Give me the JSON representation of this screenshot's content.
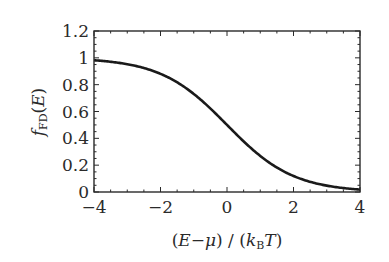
{
  "chart_data": {
    "type": "line",
    "title": "",
    "xlabel": "(E−μ) / (k_B T)",
    "ylabel": "f_FD(E)",
    "xlabel_parts": {
      "open1": "(",
      "E": "E",
      "minus": "−",
      "mu": "μ",
      "close1": ")",
      "slash": " / ",
      "open2": "(",
      "k": "k",
      "B": "B",
      "T": "T",
      "close2": ")"
    },
    "ylabel_parts": {
      "f": "f",
      "sub": "FD",
      "open": "(",
      "E": "E",
      "close": ")"
    },
    "xlim": [
      -4,
      4
    ],
    "ylim": [
      0,
      1.2
    ],
    "xticks": [
      -4,
      -2,
      0,
      2,
      4
    ],
    "xtick_labels": [
      "−4",
      "−2",
      "0",
      "2",
      "4"
    ],
    "yticks": [
      0,
      0.2,
      0.4,
      0.6,
      0.8,
      1,
      1.2
    ],
    "ytick_labels": [
      "0",
      "0.2",
      "0.4",
      "0.6",
      "0.8",
      "1",
      "1.2"
    ],
    "grid": false,
    "legend": "none",
    "series": [
      {
        "name": "Fermi-Dirac distribution",
        "function": "1/(1+exp(x))",
        "x": [
          -4,
          -3.5,
          -3,
          -2.5,
          -2,
          -1.5,
          -1,
          -0.5,
          0,
          0.5,
          1,
          1.5,
          2,
          2.5,
          3,
          3.5,
          4
        ],
        "y": [
          0.982,
          0.971,
          0.953,
          0.924,
          0.881,
          0.818,
          0.731,
          0.622,
          0.5,
          0.378,
          0.269,
          0.182,
          0.119,
          0.076,
          0.047,
          0.029,
          0.018
        ],
        "color": "#1a1a1a"
      }
    ]
  }
}
